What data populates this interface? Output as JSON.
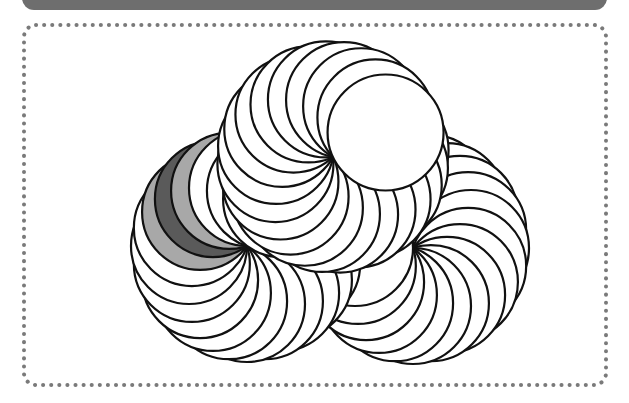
{
  "colors": {
    "background": "#ffffff",
    "header_bar": "#6e6e6e",
    "frame_dots": "#7a7a7a",
    "stroke": "#111111",
    "circle_fill": "#ffffff",
    "light_gray": "#a8a8a8",
    "dark_gray": "#5a5a5a"
  },
  "frame": {
    "x": 24,
    "y": 25,
    "width": 582,
    "height": 360,
    "corner_radius": 12,
    "dot_size": 4,
    "dot_gap": 8
  },
  "diagram": {
    "circles_per_rosette": 20,
    "radius": 58,
    "stroke_width": 2.2,
    "rosettes": [
      {
        "name": "right-rosette",
        "pivot": [
          413,
          248
        ],
        "start_angle_deg": 198,
        "shaded": []
      },
      {
        "name": "left-rosette",
        "pivot": [
          247,
          246
        ],
        "start_angle_deg": 324,
        "shaded": [
          {
            "angle_deg": 216,
            "fill": "light_gray"
          },
          {
            "angle_deg": 234,
            "fill": "dark_gray"
          },
          {
            "angle_deg": 252,
            "fill": "light_gray"
          }
        ]
      },
      {
        "name": "top-rosette",
        "pivot": [
          333,
          157
        ],
        "start_angle_deg": 353,
        "shaded": []
      }
    ]
  }
}
